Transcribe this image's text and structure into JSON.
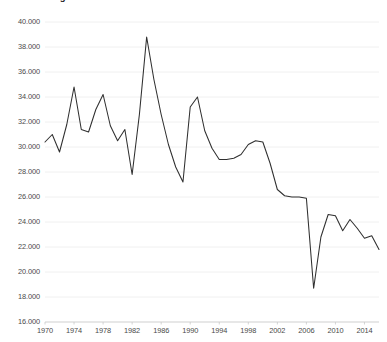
{
  "chart_data": {
    "type": "line",
    "title": "Volkszählung in Zahlen",
    "xlabel": "",
    "ylabel": "",
    "grid": true,
    "legend": null,
    "xlim": [
      1970,
      2016
    ],
    "ylim": [
      16000,
      40000
    ],
    "ytick_labels": [
      "40.000",
      "38.000",
      "36.000",
      "34.000",
      "32.000",
      "30.000",
      "28.000",
      "26.000",
      "24.000",
      "22.000",
      "20.000",
      "18.000",
      "16.000"
    ],
    "ytick_values": [
      40000,
      38000,
      36000,
      34000,
      32000,
      30000,
      28000,
      26000,
      24000,
      22000,
      20000,
      18000,
      16000
    ],
    "xtick_labels": [
      "1970",
      "1974",
      "1978",
      "1982",
      "1986",
      "1990",
      "1994",
      "1998",
      "2002",
      "2006",
      "2010",
      "2014"
    ],
    "xtick_values": [
      1970,
      1974,
      1978,
      1982,
      1986,
      1990,
      1994,
      1998,
      2002,
      2006,
      2010,
      2014
    ],
    "series": [
      {
        "name": "Wert",
        "color": "#2f2f2f",
        "x": [
          1970,
          1971,
          1972,
          1973,
          1974,
          1975,
          1976,
          1977,
          1978,
          1979,
          1980,
          1981,
          1982,
          1983,
          1984,
          1985,
          1986,
          1987,
          1988,
          1989,
          1990,
          1991,
          1992,
          1993,
          1994,
          1995,
          1996,
          1997,
          1998,
          1999,
          2000,
          2001,
          2002,
          2003,
          2004,
          2005,
          2006,
          2007,
          2008,
          2009,
          2010,
          2011,
          2012,
          2013,
          2014,
          2015,
          2016
        ],
        "values": [
          30400,
          31000,
          29600,
          31800,
          34800,
          31400,
          31200,
          33000,
          34200,
          31700,
          30500,
          31400,
          27800,
          32600,
          38800,
          35400,
          32600,
          30200,
          28400,
          27200,
          33200,
          34000,
          31300,
          29900,
          29000,
          29000,
          29100,
          29400,
          30200,
          30500,
          30400,
          28700,
          26600,
          26100,
          26000,
          26000,
          25900,
          18700,
          22800,
          24600,
          24500,
          23300,
          24200,
          23500,
          22700,
          22900,
          21800
        ]
      }
    ]
  }
}
